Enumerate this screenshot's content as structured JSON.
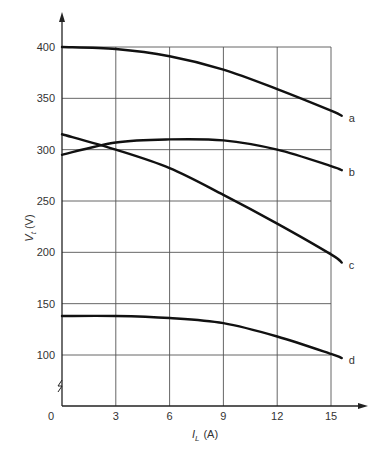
{
  "chart_data": {
    "type": "line",
    "title": "",
    "xlabel": "I_L (A)",
    "xlabel_main": "I",
    "xlabel_sub": "L",
    "xlabel_unit": "(A)",
    "ylabel": "V_t (V)",
    "ylabel_main": "V",
    "ylabel_sub": "t",
    "ylabel_unit": "(V)",
    "xlim": [
      0,
      15.6
    ],
    "ylim": [
      100,
      400
    ],
    "y_axis_break": true,
    "grid": true,
    "x_ticks": [
      "0",
      "3",
      "6",
      "9",
      "12",
      "15"
    ],
    "y_ticks": [
      "400",
      "350",
      "300",
      "250",
      "200",
      "150",
      "100"
    ],
    "x": [
      0,
      3,
      6,
      9,
      12,
      15,
      15.6
    ],
    "series": [
      {
        "name": "a",
        "values": [
          400,
          398,
          391,
          378,
          359,
          338,
          333
        ]
      },
      {
        "name": "b",
        "values": [
          295,
          307,
          310,
          309,
          300,
          284,
          280
        ]
      },
      {
        "name": "c",
        "values": [
          315,
          300,
          282,
          256,
          228,
          198,
          190
        ]
      },
      {
        "name": "d",
        "values": [
          138,
          138,
          136,
          131,
          118,
          101,
          97
        ]
      }
    ],
    "legend": "inline labels at right end of each curve"
  },
  "layout": {
    "x_px": [
      62,
      116,
      170,
      224,
      278,
      331
    ],
    "y_px": {
      "400": 47,
      "350": 98,
      "300": 150,
      "250": 201,
      "200": 253,
      "150": 304,
      "100": 355
    },
    "axis_y_px": 406
  }
}
